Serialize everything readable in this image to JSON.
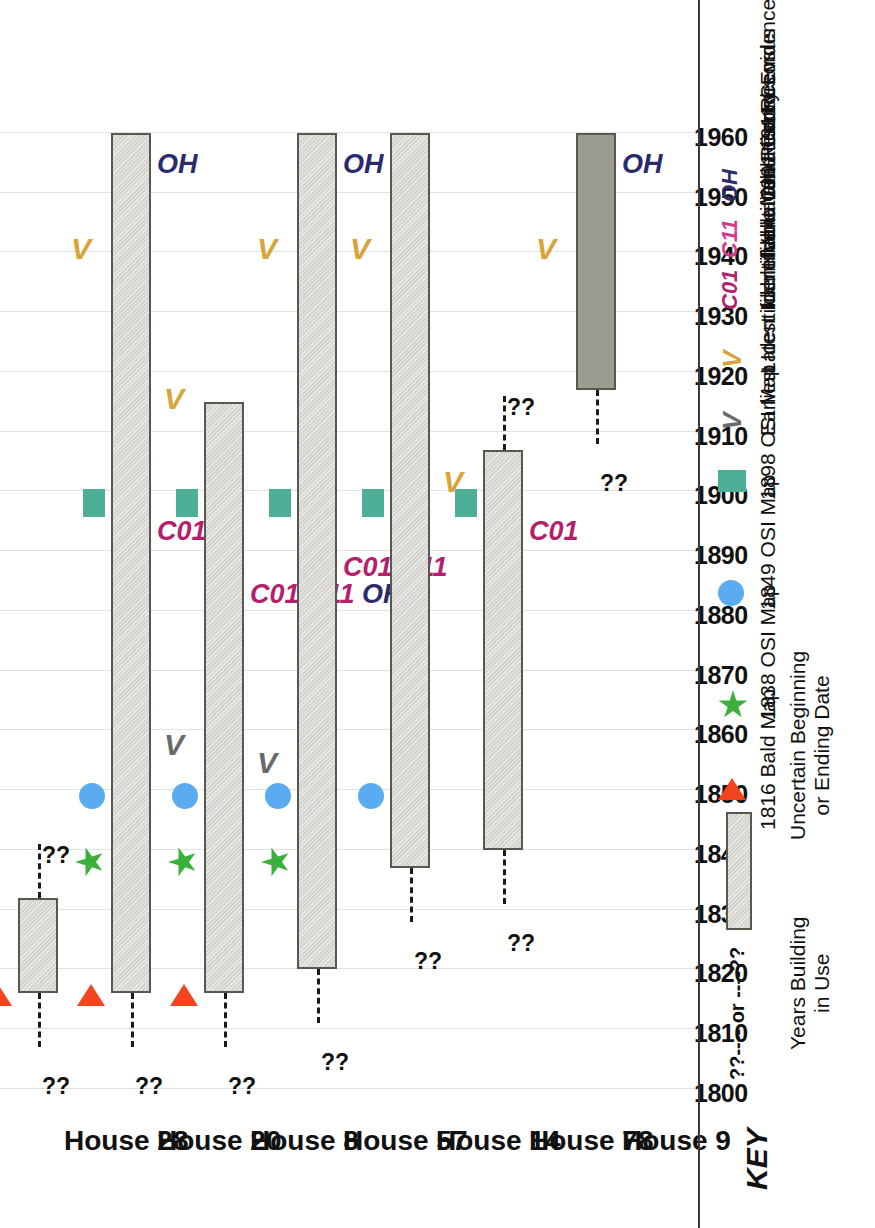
{
  "chart_data": {
    "type": "bar",
    "orientation": "horizontal-gantt-rotated",
    "title": "",
    "xlabel": "",
    "ylabel": "",
    "xlim": [
      1800,
      1964
    ],
    "grid": true,
    "tick_labels": [
      "1800",
      "1810",
      "1820",
      "1830",
      "1840",
      "1850",
      "1860",
      "1870",
      "1880",
      "1890",
      "1900",
      "1910",
      "1920",
      "1930",
      "1940",
      "1950",
      "1960"
    ],
    "tick_values": [
      1800,
      1810,
      1820,
      1830,
      1840,
      1850,
      1860,
      1870,
      1880,
      1890,
      1900,
      1910,
      1920,
      1930,
      1940,
      1950,
      1960
    ],
    "categories": [
      "House 28",
      "House 20",
      "House 8",
      "House 57",
      "House 14",
      "House 78",
      "House 9"
    ],
    "rows": [
      {
        "label": "House 28",
        "bar_start": 1816,
        "bar_end": 1832,
        "bar_shade": "light",
        "uncertain_start": true,
        "uncertain_end": true,
        "markers": [
          {
            "symbol": "triangle",
            "name": "1816 Bald Map",
            "year": 1816
          }
        ],
        "vmarks": [],
        "source_labels": []
      },
      {
        "label": "House 20",
        "bar_start": 1816,
        "bar_end": 1960,
        "bar_shade": "light",
        "uncertain_start": true,
        "uncertain_end": false,
        "markers": [
          {
            "symbol": "triangle",
            "name": "1816 Bald Map",
            "year": 1816
          },
          {
            "symbol": "star",
            "name": "1838 OSI Map",
            "year": 1838
          },
          {
            "symbol": "circle",
            "name": "1849 OSI Map",
            "year": 1849
          },
          {
            "symbol": "square",
            "name": "1898 OSI Map",
            "year": 1898
          }
        ],
        "vmarks": [
          {
            "text": "V",
            "kind": "gold",
            "year": 1940
          }
        ],
        "source_labels": [
          {
            "text": "C01",
            "kind": "c",
            "year": 1900
          },
          {
            "text": "OH",
            "kind": "oh",
            "year": 1960
          }
        ]
      },
      {
        "label": "House 8",
        "bar_start": 1816,
        "bar_end": 1915,
        "bar_shade": "light",
        "uncertain_start": true,
        "uncertain_end": false,
        "markers": [
          {
            "symbol": "triangle",
            "name": "1816 Bald Map",
            "year": 1816
          },
          {
            "symbol": "star",
            "name": "1838 OSI Map",
            "year": 1838
          },
          {
            "symbol": "circle",
            "name": "1849 OSI Map",
            "year": 1849
          },
          {
            "symbol": "square",
            "name": "1898 OSI Map",
            "year": 1898
          }
        ],
        "vmarks": [
          {
            "text": "V",
            "kind": "gray",
            "year": 1857
          },
          {
            "text": "V",
            "kind": "gold",
            "year": 1915
          }
        ],
        "source_labels": [
          {
            "text": "C01 C11 OH",
            "kind": "c-oh",
            "year": 1900
          }
        ]
      },
      {
        "label": "House 57",
        "bar_start": 1820,
        "bar_end": 1960,
        "bar_shade": "light",
        "uncertain_start": true,
        "uncertain_end": false,
        "markers": [
          {
            "symbol": "star",
            "name": "1838 OSI Map",
            "year": 1838
          },
          {
            "symbol": "circle",
            "name": "1849 OSI Map",
            "year": 1849
          },
          {
            "symbol": "square",
            "name": "1898 OSI Map",
            "year": 1898
          }
        ],
        "vmarks": [
          {
            "text": "V",
            "kind": "gray",
            "year": 1854
          },
          {
            "text": "V",
            "kind": "gold",
            "year": 1940
          }
        ],
        "source_labels": [
          {
            "text": "C01 C11",
            "kind": "c",
            "year": 1900
          },
          {
            "text": "OH",
            "kind": "oh",
            "year": 1960
          }
        ]
      },
      {
        "label": "House 14",
        "bar_start": 1837,
        "bar_end": 1960,
        "bar_shade": "light",
        "uncertain_start": true,
        "uncertain_end": false,
        "markers": [
          {
            "symbol": "circle",
            "name": "1849 OSI Map",
            "year": 1849
          },
          {
            "symbol": "square",
            "name": "1898 OSI Map",
            "year": 1898
          }
        ],
        "vmarks": [
          {
            "text": "V",
            "kind": "gold",
            "year": 1940
          }
        ],
        "source_labels": []
      },
      {
        "label": "House 78",
        "bar_start": 1840,
        "bar_end": 1907,
        "bar_shade": "light",
        "uncertain_start": true,
        "uncertain_end": true,
        "markers": [
          {
            "symbol": "square",
            "name": "1898 OSI Map",
            "year": 1898
          }
        ],
        "vmarks": [
          {
            "text": "V",
            "kind": "gold",
            "year": 1901
          }
        ],
        "source_labels": [
          {
            "text": "C01",
            "kind": "c",
            "year": 1900
          }
        ]
      },
      {
        "label": "House 9",
        "bar_start": 1917,
        "bar_end": 1960,
        "bar_shade": "dark",
        "uncertain_start": true,
        "uncertain_end": false,
        "markers": [],
        "vmarks": [
          {
            "text": "V",
            "kind": "gold",
            "year": 1940
          }
        ],
        "source_labels": [
          {
            "text": "OH",
            "kind": "oh",
            "year": 1960
          }
        ]
      }
    ],
    "uncertain_marker_text": "??"
  },
  "key": {
    "title": "KEY",
    "bar_caption_line1": "Years Building",
    "bar_caption_line2": "in Use",
    "dash_sample": "??----  or  ----??",
    "dash_caption_line1": "Uncertain Beginning",
    "dash_caption_line2": "or Ending Date",
    "map_entries": [
      {
        "symbol": "triangle",
        "icon_name": "triangle-icon",
        "label": "1816 Bald Map",
        "color": "#f4441e"
      },
      {
        "symbol": "star",
        "icon_name": "star-icon",
        "label": "1838 OSI Map",
        "color": "#3cb03c"
      },
      {
        "symbol": "circle",
        "icon_name": "circle-icon",
        "label": "1849 OSI Map",
        "color": "#5aabf0"
      },
      {
        "symbol": "square",
        "icon_name": "square-icon",
        "label": "1898 OSI Map",
        "color": "#4caf96"
      }
    ],
    "evidence_entries": [
      {
        "glyph": "V",
        "label": "Earliest Identifiable Valuation Record",
        "color": "#6a6a6a"
      },
      {
        "glyph": "V",
        "label": "Latest Identifiable Valuation Record",
        "color": "#d8a43a"
      },
      {
        "glyph": "C01",
        "label": "Identifiable 1901 Census",
        "color": "#b51e6b"
      },
      {
        "glyph": "C11",
        "label": "Identifiable 1911 Census",
        "color": "#d6398c"
      },
      {
        "glyph": "OH",
        "label": "Oral History Evidence",
        "color": "#2b2b6b"
      }
    ]
  },
  "colors": {
    "bar_light": "#d5d4cf",
    "bar_dark": "#9c9c93",
    "bar_border": "#58584f",
    "gridline": "#e2e2e2",
    "triangle": "#f4441e",
    "star": "#3cb03c",
    "circle": "#5aabf0",
    "square": "#4caf96",
    "v_gray": "#6a6a6a",
    "v_gold": "#d8a43a",
    "census": "#b51e6b",
    "oral_history": "#2b2b6b"
  }
}
